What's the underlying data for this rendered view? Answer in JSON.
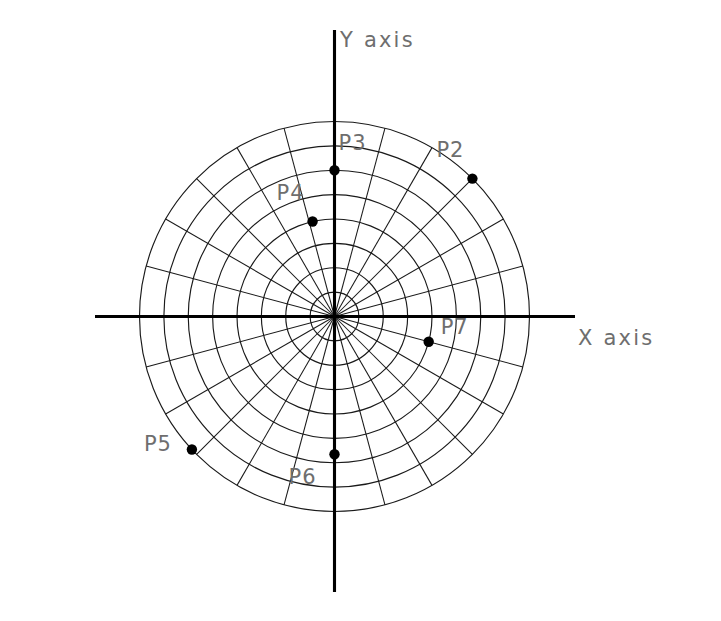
{
  "figure": {
    "background_color": "#ffffff",
    "line_color": "#1a1a1a",
    "axis_color": "#000000",
    "label_color": "#6e6e6e",
    "point_color": "#000000"
  },
  "axes": {
    "x_label": "X  axis",
    "y_label": "Y  axis"
  },
  "chart_data": {
    "type": "scatter",
    "title": "",
    "xlabel": "X  axis",
    "ylabel": "Y  axis",
    "coordinate_system": "polar",
    "grid": true,
    "legend": "none",
    "grid_rings": 8,
    "grid_ring_step": 1,
    "radial_max": 8,
    "grid_spokes": 24,
    "spoke_step_degrees": 15,
    "angle_direction": "counterclockwise",
    "angle_zero": "+X axis",
    "points": [
      {
        "label": "P2",
        "r": 8.0,
        "theta_deg": 45,
        "x": 5.66,
        "y": 5.66,
        "label_dx": -36,
        "label_dy": -28
      },
      {
        "label": "P3",
        "r": 6.0,
        "theta_deg": 90,
        "x": 0.0,
        "y": 6.0,
        "label_dx": 4,
        "label_dy": -26
      },
      {
        "label": "P4",
        "r": 4.0,
        "theta_deg": 103,
        "x": -0.9,
        "y": 3.9,
        "label_dx": -36,
        "label_dy": -28
      },
      {
        "label": "P5",
        "r": 8.0,
        "theta_deg": 223,
        "x": -5.85,
        "y": -5.46,
        "label_dx": -48,
        "label_dy": -4
      },
      {
        "label": "P6",
        "r": 5.65,
        "theta_deg": 270,
        "x": 0.0,
        "y": -5.65,
        "label_dx": -46,
        "label_dy": 24
      },
      {
        "label": "P7",
        "r": 4.0,
        "theta_deg": 345,
        "x": 3.86,
        "y": -1.04,
        "label_dx": 12,
        "label_dy": -14
      }
    ]
  }
}
